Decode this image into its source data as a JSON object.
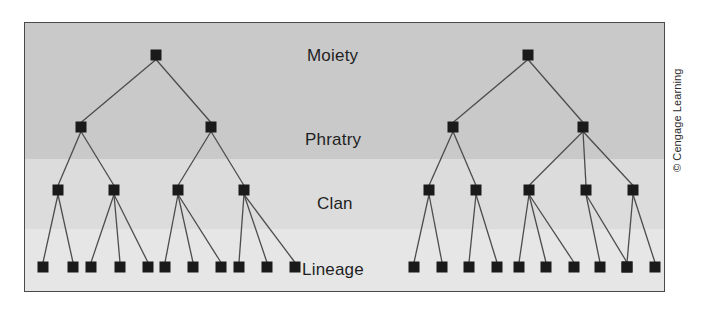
{
  "figure": {
    "credit": "© Cengage Learning",
    "frame_color": "#4a4a4a",
    "plate_background": "#d9d9d9"
  },
  "bands": [
    {
      "name": "upper-band",
      "covers": "Moiety and Phratry",
      "color": "#c9c9c9"
    },
    {
      "name": "clan-band",
      "covers": "Clan",
      "color": "#dcdcdc"
    },
    {
      "name": "lineage-band",
      "covers": "Lineage",
      "color": "#e6e6e6"
    }
  ],
  "row_labels": {
    "moiety": "Moiety",
    "phratry": "Phratry",
    "clan": "Clan",
    "lineage": "Lineage"
  },
  "diagram_data": {
    "type": "tree",
    "levels": [
      "Moiety",
      "Phratry",
      "Clan",
      "Lineage"
    ],
    "level_y": {
      "moiety": 32,
      "phratry": 104,
      "clan": 167,
      "lineage": 244
    },
    "node_size": 11,
    "node_color": "#1a1a1a",
    "edge_color": "#4c4c4c",
    "trees": [
      {
        "name": "left-moiety-tree",
        "moiety": {
          "x": 131
        },
        "phratries": [
          {
            "x": 56,
            "clans": [
              {
                "x": 33,
                "lineages": [
                  18,
                  48
                ]
              },
              {
                "x": 89,
                "lineages": [
                  66,
                  95,
                  123
                ]
              }
            ]
          },
          {
            "x": 186,
            "clans": [
              {
                "x": 153,
                "lineages": [
                  140,
                  168,
                  196
                ]
              },
              {
                "x": 219,
                "lineages": [
                  214,
                  242,
                  270
                ]
              }
            ]
          }
        ]
      },
      {
        "name": "right-moiety-tree",
        "moiety": {
          "x": 503
        },
        "phratries": [
          {
            "x": 428,
            "clans": [
              {
                "x": 404,
                "lineages": [
                  389,
                  417
                ]
              },
              {
                "x": 451,
                "lineages": [
                  444,
                  472
                ]
              }
            ]
          },
          {
            "x": 558,
            "clans": [
              {
                "x": 504,
                "lineages": [
                  494,
                  521,
                  549
                ]
              },
              {
                "x": 561,
                "lineages": [
                  575,
                  602
                ]
              },
              {
                "x": 608,
                "lineages": [
                  602,
                  630
                ]
              }
            ]
          }
        ]
      }
    ],
    "totals": {
      "moieties": 2,
      "phratries": 4,
      "clans": 9,
      "lineages": 22
    }
  }
}
